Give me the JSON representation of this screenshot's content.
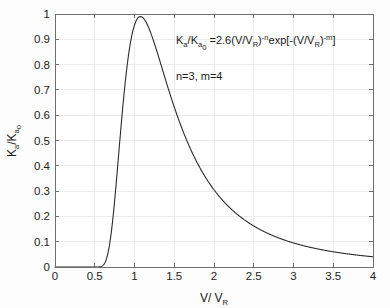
{
  "chart_data": {
    "type": "line",
    "title": "",
    "xlabel": "V/V_R",
    "ylabel": "K_a/K_a0",
    "xlim": [
      0,
      4
    ],
    "ylim": [
      0,
      1
    ],
    "grid": true,
    "legend": null,
    "equation": "K_a/K_a0 =2.6(V/V_R)^-n exp[-(V/V_R)^-m]",
    "parameters": "n=3, m=4",
    "x_ticks": [
      "0",
      "0.5",
      "1",
      "1.5",
      "2",
      "2.5",
      "3",
      "3.5",
      "4"
    ],
    "y_ticks": [
      "0",
      "0.1",
      "0.2",
      "0.3",
      "0.4",
      "0.5",
      "0.6",
      "0.7",
      "0.8",
      "0.9",
      "1"
    ],
    "x_tick_values": [
      0,
      0.5,
      1,
      1.5,
      2,
      2.5,
      3,
      3.5,
      4
    ],
    "y_tick_values": [
      0,
      0.1,
      0.2,
      0.3,
      0.4,
      0.5,
      0.6,
      0.7,
      0.8,
      0.9,
      1
    ],
    "series": [
      {
        "name": "Ka/Ka0",
        "color": "#2b2b2b",
        "x": [
          0.3,
          0.35,
          0.4,
          0.45,
          0.5,
          0.52,
          0.55,
          0.58,
          0.6,
          0.62,
          0.65,
          0.68,
          0.7,
          0.72,
          0.75,
          0.78,
          0.8,
          0.82,
          0.85,
          0.88,
          0.9,
          0.93,
          0.95,
          0.98,
          1.0,
          1.03,
          1.05,
          1.07,
          1.1,
          1.13,
          1.15,
          1.18,
          1.2,
          1.25,
          1.3,
          1.35,
          1.4,
          1.45,
          1.5,
          1.55,
          1.6,
          1.65,
          1.7,
          1.75,
          1.8,
          1.85,
          1.9,
          1.95,
          2.0,
          2.1,
          2.2,
          2.3,
          2.4,
          2.5,
          2.6,
          2.7,
          2.8,
          2.9,
          3.0,
          3.1,
          3.2,
          3.3,
          3.4,
          3.5,
          3.6,
          3.7,
          3.8,
          3.9,
          4.0
        ],
        "y": [
          0.0,
          0.0,
          0.0002,
          0.002,
          0.0106,
          0.0167,
          0.0297,
          0.0484,
          0.0635,
          0.0808,
          0.1109,
          0.1451,
          0.1696,
          0.1953,
          0.2358,
          0.2772,
          0.3052,
          0.3331,
          0.3744,
          0.4143,
          0.4398,
          0.4765,
          0.4997,
          0.5328,
          0.5537,
          0.5833,
          0.6018,
          0.6193,
          0.644,
          0.6664,
          0.68,
          0.6986,
          0.71,
          0.7345,
          0.7533,
          0.767,
          0.7761,
          0.7814,
          0.7834,
          0.7826,
          0.7795,
          0.7744,
          0.7677,
          0.7597,
          0.7505,
          0.7405,
          0.7297,
          0.7184,
          0.7066,
          0.6821,
          0.6568,
          0.6313,
          0.6059,
          0.581,
          0.5567,
          0.5332,
          0.5107,
          0.489,
          0.4684,
          0.4487,
          0.4299,
          0.4121,
          0.3951,
          0.379,
          0.3637,
          0.3492,
          0.3354,
          0.3223,
          0.3099
        ]
      }
    ]
  },
  "axis": {
    "x_label": "V/ V",
    "x_label_sub": "R",
    "y_label_main": "K",
    "y_label_sub1": "a",
    "y_label_mid": "/K",
    "y_label_sub2": "a",
    "y_label_sub3": "o"
  },
  "annotations": {
    "equation_parts": {
      "p1": "K",
      "s1": "a",
      "p2": "/K",
      "s2": "a",
      "s3": "0",
      "p3": " =2.6(V/V",
      "s4": "R",
      "p4": ")",
      "sup1": "-n",
      "p5": "exp[-(V/V",
      "s5": "R",
      "p6": ")",
      "sup2": "-m",
      "p7": "]"
    },
    "parameters_text": "n=3, m=4"
  },
  "colors": {
    "curve": "#2b2b2b",
    "grid": "#ececec",
    "axis": "#6f6f6f",
    "background": "#fdfdfd",
    "text": "#1a1a1a"
  }
}
